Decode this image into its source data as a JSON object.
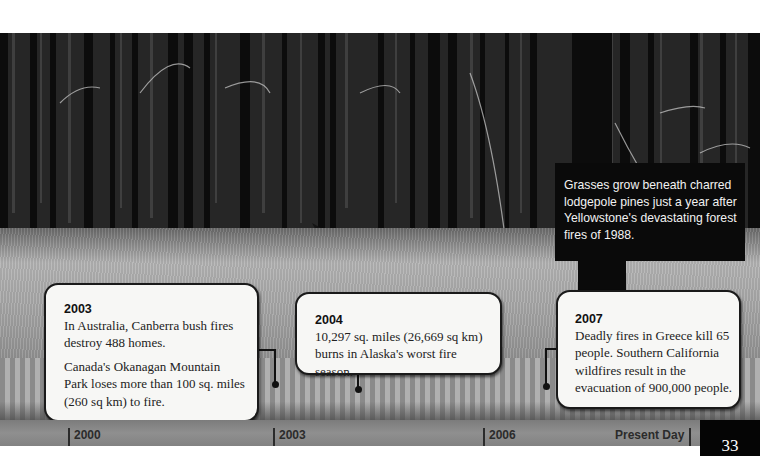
{
  "photo": {
    "subject": "burned lodgepole pine forest with regrowing grass",
    "caption": "Grasses grow beneath charred lodgepole pines just a year after Yellowstone's devastating forest fires of 1988."
  },
  "timeline": {
    "events": [
      {
        "year": "2003",
        "paragraphs": [
          "In Australia, Canberra bush fires destroy 488 homes.",
          "Canada's Okanagan Mountain Park loses more than 100 sq. miles (260 sq km) to fire."
        ]
      },
      {
        "year": "2004",
        "paragraphs": [
          "10,297 sq. miles (26,669 sq km) burns in Alaska's worst fire season."
        ]
      },
      {
        "year": "2007",
        "paragraphs": [
          "Deadly fires in Greece kill 65 people. Southern California wildfires result in the evacuation of 900,000 people."
        ]
      }
    ],
    "axis_labels": [
      "2000",
      "2003",
      "2006",
      "Present Day"
    ]
  },
  "page_number": "33",
  "colors": {
    "callout_bg": "#f7f7f5",
    "caption_bg": "#0a0a0a",
    "ruler": "#8a8a8a",
    "page_box": "#050505"
  }
}
